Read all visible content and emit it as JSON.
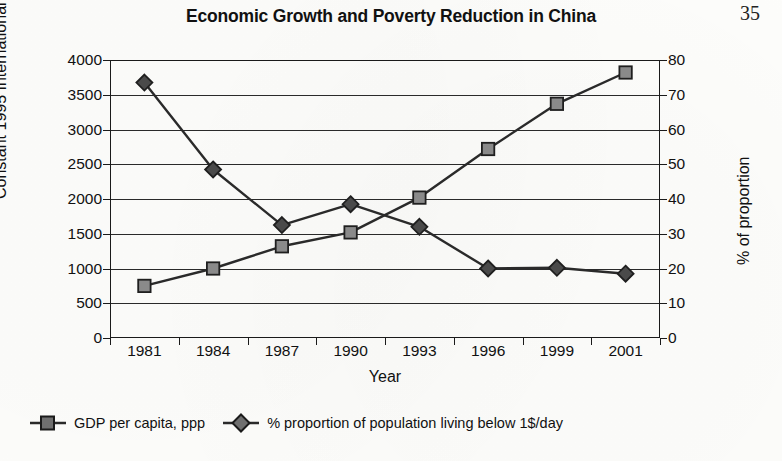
{
  "page": {
    "number": "35"
  },
  "chart_data": {
    "type": "line",
    "title": "Economic Growth and Poverty Reduction in China",
    "xlabel": "Year",
    "ylabel": "Constant 1995 International $",
    "y2label": "% of proportion",
    "categories": [
      "1981",
      "1984",
      "1987",
      "1990",
      "1993",
      "1996",
      "1999",
      "2001"
    ],
    "ylim": [
      0,
      4000
    ],
    "y2lim": [
      0,
      80
    ],
    "yticks": [
      "0",
      "500",
      "1000",
      "1500",
      "2000",
      "2500",
      "3000",
      "3500",
      "4000"
    ],
    "ytick_values": [
      0,
      500,
      1000,
      1500,
      2000,
      2500,
      3000,
      3500,
      4000
    ],
    "y2ticks": [
      "0",
      "10",
      "20",
      "30",
      "40",
      "50",
      "60",
      "70",
      "80"
    ],
    "y2tick_values": [
      0,
      10,
      20,
      30,
      40,
      50,
      60,
      70,
      80
    ],
    "grid": true,
    "legend_position": "bottom-left",
    "series": [
      {
        "name": "GDP per capita, ppp",
        "axis": "left",
        "marker": "square",
        "color": "#8a8a8a",
        "line_color": "#2a2a2a",
        "values": [
          750,
          1000,
          1320,
          1520,
          2020,
          2720,
          3370,
          3820
        ]
      },
      {
        "name": "% proportion of population living below 1$/day",
        "axis": "right",
        "marker": "diamond",
        "color": "#4a4a4a",
        "line_color": "#2a2a2a",
        "values": [
          73.5,
          48.5,
          32.5,
          38.5,
          32.0,
          20.0,
          20.2,
          18.5
        ]
      }
    ]
  },
  "legend": {
    "items": [
      {
        "label": "GDP per capita, ppp",
        "marker": "square"
      },
      {
        "label": "% proportion of population living below 1$/day",
        "marker": "diamond"
      }
    ]
  }
}
